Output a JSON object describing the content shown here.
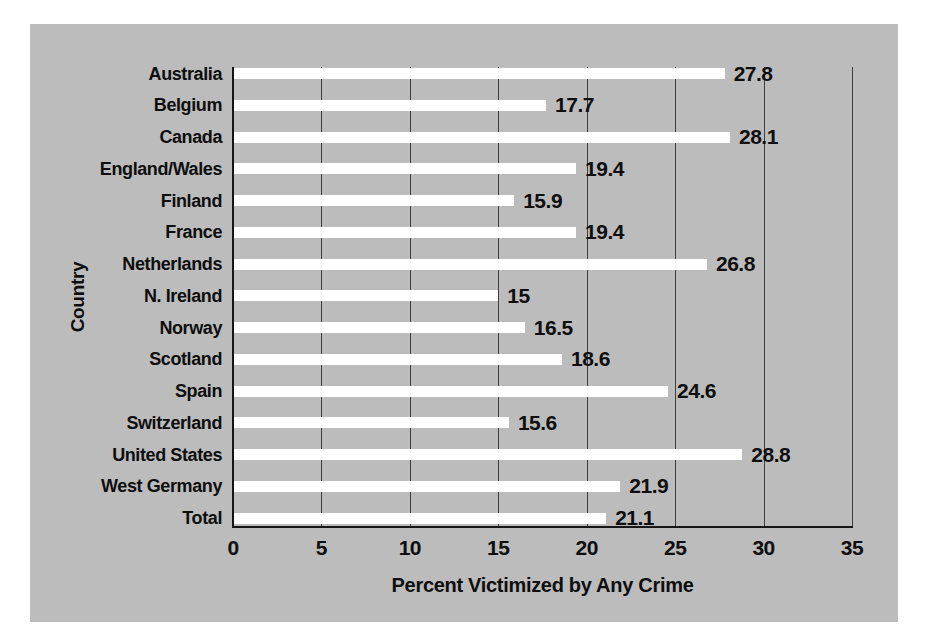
{
  "figure": {
    "background_color": "#ffffff",
    "panel_color": "#bcbcbc"
  },
  "chart_data": {
    "type": "bar",
    "orientation": "horizontal",
    "title": "",
    "xlabel": "Percent Victimized by Any Crime",
    "ylabel": "Country",
    "categories": [
      "Australia",
      "Belgium",
      "Canada",
      "England/Wales",
      "Finland",
      "France",
      "Netherlands",
      "N. Ireland",
      "Norway",
      "Scotland",
      "Spain",
      "Switzerland",
      "United States",
      "West Germany",
      "Total"
    ],
    "values": [
      27.8,
      17.7,
      28.1,
      19.4,
      15.9,
      19.4,
      26.8,
      15,
      16.5,
      18.6,
      24.6,
      15.6,
      28.8,
      21.9,
      21.1
    ],
    "value_labels": [
      "27.8",
      "17.7",
      "28.1",
      "19.4",
      "15.9",
      "19.4",
      "26.8",
      "15",
      "16.5",
      "18.6",
      "24.6",
      "15.6",
      "28.8",
      "21.9",
      "21.1"
    ],
    "xlim": [
      0,
      35
    ],
    "xticks": [
      0,
      5,
      10,
      15,
      20,
      25,
      30,
      35
    ],
    "grid": true,
    "legend_position": "none",
    "bar_color": "#ffffff",
    "plot_background": "#bcbcbc",
    "gridline_color": "#3f3f3f",
    "axis_color": "#161616",
    "text_color": "#0e0e0e"
  }
}
